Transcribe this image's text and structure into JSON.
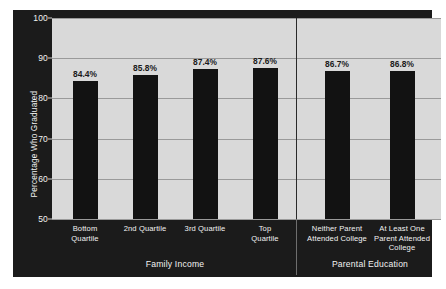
{
  "chart_data": {
    "type": "bar",
    "title": "",
    "xlabel": "",
    "ylabel": "Percentage Who Graduated",
    "ylim": [
      50,
      100
    ],
    "yticks": [
      "50",
      "60",
      "70",
      "80",
      "90",
      "100"
    ],
    "grid": true,
    "legend": "none",
    "categories": [
      "Bottom\nQuartile",
      "2nd Quartile",
      "3rd Quartile",
      "Top\nQuartile",
      "Neither Parent\nAttended College",
      "At Least One\nParent Attended\nCollege"
    ],
    "values": [
      84.4,
      85.8,
      87.4,
      87.6,
      86.7,
      86.8
    ],
    "value_labels": [
      "84.4%",
      "85.8%",
      "87.4%",
      "87.6%",
      "86.7%",
      "86.8%"
    ],
    "groups": [
      {
        "name": "Family Income",
        "categories": [
          "Bottom\nQuartile",
          "2nd Quartile",
          "3rd Quartile",
          "Top\nQuartile"
        ],
        "values": [
          84.4,
          85.8,
          87.4,
          87.6
        ]
      },
      {
        "name": "Parental Education",
        "categories": [
          "Neither Parent\nAttended College",
          "At Least One\nParent Attended\nCollege"
        ],
        "values": [
          86.7,
          86.8
        ]
      }
    ],
    "colors": {
      "bar": "#121212",
      "plot_background": "#d9d9d9",
      "figure_background": "#1b1b1b",
      "gridline": "#9a9a9a",
      "axis_text": "#f2f2f2",
      "value_text": "#1a1a1a"
    }
  },
  "axis": {
    "y_label": "Percentage Who Graduated",
    "ticks": [
      {
        "label": "100",
        "value": 100
      },
      {
        "label": "90",
        "value": 90
      },
      {
        "label": "80",
        "value": 80
      },
      {
        "label": "70",
        "value": 70
      },
      {
        "label": "60",
        "value": 60
      },
      {
        "label": "50",
        "value": 50
      }
    ]
  },
  "bars": [
    {
      "label": "84.4%",
      "value": 84.4,
      "category": "Bottom\nQuartile",
      "group": "Family Income"
    },
    {
      "label": "85.8%",
      "value": 85.8,
      "category": "2nd Quartile",
      "group": "Family Income"
    },
    {
      "label": "87.4%",
      "value": 87.4,
      "category": "3rd Quartile",
      "group": "Family Income"
    },
    {
      "label": "87.6%",
      "value": 87.6,
      "category": "Top\nQuartile",
      "group": "Family Income"
    },
    {
      "label": "86.7%",
      "value": 86.7,
      "category": "Neither Parent\nAttended College",
      "group": "Parental Education"
    },
    {
      "label": "86.8%",
      "value": 86.8,
      "category": "At Least One\nParent Attended\nCollege",
      "group": "Parental Education"
    }
  ],
  "group_titles": [
    {
      "label": "Family Income"
    },
    {
      "label": "Parental Education"
    }
  ]
}
